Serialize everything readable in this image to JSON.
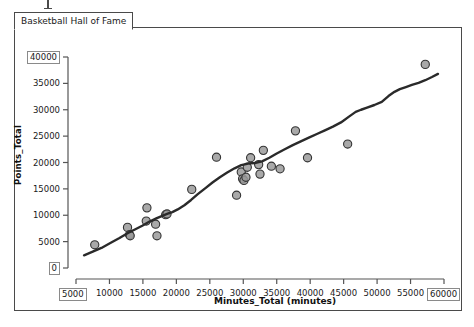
{
  "window": {
    "tab_label": "Basketball Hall of Fame"
  },
  "chart_data": {
    "type": "scatter",
    "title": "Basketball Hall of Fame",
    "xlabel": "Minutes_Total (minutes)",
    "ylabel": "Points_Total",
    "xlim": [
      5000,
      60000
    ],
    "ylim": [
      0,
      40000
    ],
    "xticks": [
      5000,
      10000,
      15000,
      20000,
      25000,
      30000,
      35000,
      40000,
      45000,
      50000,
      55000,
      60000
    ],
    "yticks": [
      0,
      5000,
      10000,
      15000,
      20000,
      25000,
      30000,
      35000,
      40000
    ],
    "xtick_labels": [
      "5000",
      "10000",
      "15000",
      "20000",
      "25000",
      "30000",
      "35000",
      "40000",
      "45000",
      "50000",
      "55000",
      "60000"
    ],
    "ytick_labels": [
      "0",
      "5000",
      "10000",
      "15000",
      "20000",
      "25000",
      "30000",
      "35000",
      "40000"
    ],
    "grid": false,
    "legend": "none",
    "marker_fill": "#9a9a9a",
    "marker_edge": "#333333",
    "line_color": "#2a2a2a",
    "series": [
      {
        "name": "Hall of Fame players",
        "type": "scatter",
        "points": [
          [
            7800,
            4400
          ],
          [
            12700,
            7700
          ],
          [
            13000,
            6300
          ],
          [
            13100,
            6100
          ],
          [
            15500,
            8900
          ],
          [
            15600,
            11400
          ],
          [
            16900,
            8300
          ],
          [
            17100,
            6100
          ],
          [
            18400,
            10100
          ],
          [
            18600,
            10250
          ],
          [
            22300,
            14900
          ],
          [
            26000,
            21000
          ],
          [
            29000,
            13800
          ],
          [
            29700,
            18200
          ],
          [
            29900,
            16900
          ],
          [
            30100,
            16600
          ],
          [
            30400,
            17200
          ],
          [
            30600,
            19100
          ],
          [
            31100,
            20900
          ],
          [
            32300,
            19600
          ],
          [
            32500,
            17800
          ],
          [
            33000,
            22300
          ],
          [
            34200,
            19300
          ],
          [
            35500,
            18800
          ],
          [
            37800,
            26000
          ],
          [
            39600,
            20900
          ],
          [
            45600,
            23500
          ],
          [
            57200,
            38600
          ]
        ]
      },
      {
        "name": "Smoothed fit",
        "type": "line",
        "points": [
          [
            6200,
            2400
          ],
          [
            7500,
            3100
          ],
          [
            8800,
            3800
          ],
          [
            10200,
            4800
          ],
          [
            11500,
            5700
          ],
          [
            12700,
            6600
          ],
          [
            13800,
            7300
          ],
          [
            14900,
            8000
          ],
          [
            16000,
            8800
          ],
          [
            17000,
            9400
          ],
          [
            17900,
            9900
          ],
          [
            18700,
            10300
          ],
          [
            19400,
            10600
          ],
          [
            20200,
            11100
          ],
          [
            21200,
            11900
          ],
          [
            22200,
            12900
          ],
          [
            23200,
            14000
          ],
          [
            24300,
            15100
          ],
          [
            25400,
            16200
          ],
          [
            26500,
            17200
          ],
          [
            27600,
            18100
          ],
          [
            28700,
            18900
          ],
          [
            29700,
            19500
          ],
          [
            30700,
            19800
          ],
          [
            31700,
            19900
          ],
          [
            32800,
            20200
          ],
          [
            33900,
            20900
          ],
          [
            35000,
            21700
          ],
          [
            36200,
            22500
          ],
          [
            37400,
            23300
          ],
          [
            38600,
            24000
          ],
          [
            39800,
            24700
          ],
          [
            41000,
            25400
          ],
          [
            42200,
            26100
          ],
          [
            43400,
            26800
          ],
          [
            44600,
            27600
          ],
          [
            45800,
            28700
          ],
          [
            46800,
            29600
          ],
          [
            47600,
            30000
          ],
          [
            48500,
            30400
          ],
          [
            49600,
            30900
          ],
          [
            50700,
            31500
          ],
          [
            51700,
            32600
          ],
          [
            52600,
            33400
          ],
          [
            53400,
            33900
          ],
          [
            54300,
            34300
          ],
          [
            55200,
            34700
          ],
          [
            56200,
            35100
          ],
          [
            57200,
            35600
          ],
          [
            58200,
            36200
          ],
          [
            59100,
            36800
          ]
        ]
      }
    ]
  }
}
